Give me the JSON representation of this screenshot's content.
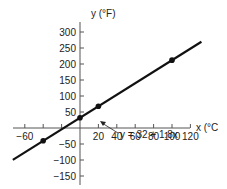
{
  "chart_data": {
    "type": "line",
    "title": "",
    "xlabel": "x (°C)",
    "ylabel": "y (°F)",
    "xlim": [
      -73,
      132
    ],
    "ylim": [
      -170,
      320
    ],
    "x_ticks": [
      -60,
      -40,
      -20,
      20,
      40,
      60,
      80,
      100,
      120
    ],
    "x_tick_labels": [
      "-60",
      "20",
      "40",
      "60",
      "80",
      "100",
      "120"
    ],
    "y_ticks": [
      300,
      250,
      200,
      150,
      100,
      50,
      -50,
      -100,
      -150
    ],
    "y_tick_labels": [
      "300",
      "250",
      "200",
      "150",
      "100",
      "50",
      "-50",
      "-100",
      "-150"
    ],
    "grid": false,
    "series": [
      {
        "name": "y = 32 + 1.8x",
        "equation": "y = 32 + 1.8x",
        "line_x": [
          -73,
          132
        ],
        "line_y": [
          -99.4,
          269.6
        ],
        "points_x": [
          -40,
          0,
          20,
          100
        ],
        "points_y": [
          -40,
          32,
          68,
          212
        ]
      }
    ],
    "annotations": [
      {
        "text": "y = 32 + 1.8x",
        "arrow_to": [
          45,
          113
        ]
      }
    ]
  },
  "labels": {
    "ylabel": "y (°F)",
    "xlabel": "x (°C",
    "equation": "y = 32 + 1.8x"
  }
}
